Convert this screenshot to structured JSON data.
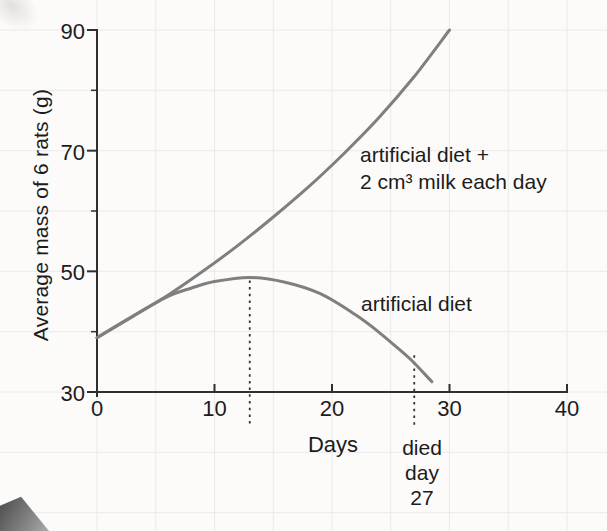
{
  "chart_data": {
    "type": "line",
    "title": "",
    "xlabel": "Days",
    "ylabel": "Average mass of 6 rats (g)",
    "xlim": [
      0,
      40
    ],
    "ylim": [
      30,
      90
    ],
    "x_ticks": [
      0,
      10,
      20,
      30,
      40
    ],
    "y_ticks": [
      30,
      50,
      70,
      90
    ],
    "y_minor_ticks": [
      40,
      60,
      80
    ],
    "grid": "faint graph-paper grid",
    "legend_position": "inline-labels",
    "colors": {
      "curve": "#7f7f7f",
      "axis": "#2f2f2f",
      "text": "#1c1c1c",
      "grid": "#eceae6",
      "dashed": "#333333"
    },
    "series": [
      {
        "name": "artificial diet + 2 cm³ milk each day",
        "label_lines": [
          "artificial diet +",
          "2 cm³ milk each day"
        ],
        "points": [
          [
            0,
            39
          ],
          [
            3,
            42.5
          ],
          [
            6,
            46
          ],
          [
            9,
            50
          ],
          [
            12,
            54.3
          ],
          [
            15,
            59
          ],
          [
            18,
            64
          ],
          [
            21,
            69.5
          ],
          [
            24,
            75.5
          ],
          [
            27,
            82.3
          ],
          [
            30,
            90
          ]
        ]
      },
      {
        "name": "artificial diet",
        "label": "artificial diet",
        "points": [
          [
            0,
            39
          ],
          [
            3,
            42.5
          ],
          [
            6,
            45.8
          ],
          [
            8,
            47.2
          ],
          [
            10,
            48.3
          ],
          [
            13,
            49
          ],
          [
            16,
            48.2
          ],
          [
            19,
            46.3
          ],
          [
            22,
            42.8
          ],
          [
            24,
            39.9
          ],
          [
            26,
            36.6
          ],
          [
            27,
            34.8
          ],
          [
            28.5,
            31.7
          ]
        ]
      }
    ],
    "annotations": [
      {
        "type": "dashed-vline",
        "x": 13,
        "from_mass": 48.5,
        "label_lines": []
      },
      {
        "type": "dashed-vline",
        "x": 27,
        "from_mass": 36.1,
        "label_lines": [
          "died",
          "day",
          "27"
        ]
      }
    ]
  }
}
